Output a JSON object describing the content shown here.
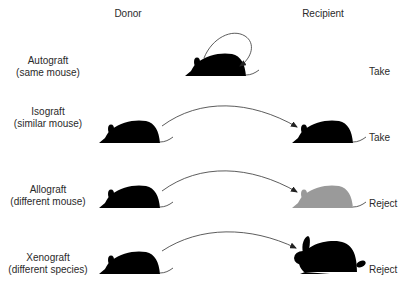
{
  "headers": {
    "donor": "Donor",
    "recipient": "Recipient"
  },
  "rows": [
    {
      "name": "Autograft",
      "desc": "(same mouse)",
      "outcome": "Take",
      "donor_icon": "mouse-icon",
      "recipient_icon": "mouse-icon",
      "recipient_color": "#000000"
    },
    {
      "name": "Isograft",
      "desc": "(similar mouse)",
      "outcome": "Take",
      "donor_icon": "mouse-icon",
      "recipient_icon": "mouse-icon",
      "recipient_color": "#000000"
    },
    {
      "name": "Allograft",
      "desc": "(different mouse)",
      "outcome": "Reject",
      "donor_icon": "mouse-icon",
      "recipient_icon": "mouse-icon",
      "recipient_color": "#9a9a9a"
    },
    {
      "name": "Xenograft",
      "desc": "(different species)",
      "outcome": "Reject",
      "donor_icon": "mouse-icon",
      "recipient_icon": "rabbit-icon",
      "recipient_color": "#000000"
    }
  ]
}
